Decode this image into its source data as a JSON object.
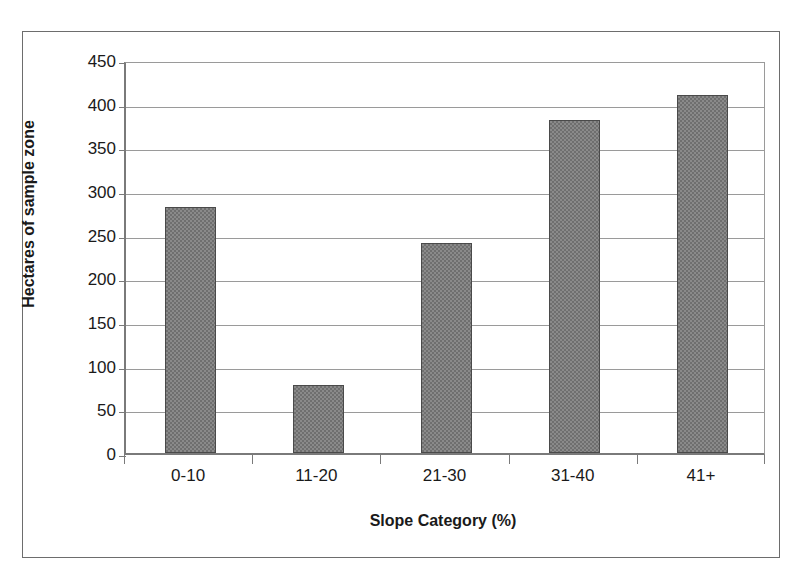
{
  "chart_data": {
    "type": "bar",
    "title": "",
    "subtitle": "",
    "categories": [
      "0-10",
      "11-20",
      "21-30",
      "31-40",
      "41+"
    ],
    "values": [
      282,
      78,
      241,
      381,
      410
    ],
    "xlabel": "Slope Category (%)",
    "ylabel": "Hectares of sample zone",
    "ylim": [
      0,
      450
    ],
    "ytick_step": 50,
    "yticks": [
      0,
      50,
      100,
      150,
      200,
      250,
      300,
      350,
      400,
      450
    ],
    "ytick_labels": [
      "0",
      "50",
      "100",
      "150",
      "200",
      "250",
      "300",
      "350",
      "400",
      "450"
    ],
    "grid": "horizontal",
    "legend": "none",
    "bar_fill_color": "#8a8a8a",
    "bar_border_color": "#4a4a4a",
    "gridline_color": "#9a9a9a",
    "axis_color": "#7a7a7a",
    "text_color": "#1a1a1a",
    "background_color": "#ffffff",
    "frame_border_color": "#6d6d6d"
  }
}
